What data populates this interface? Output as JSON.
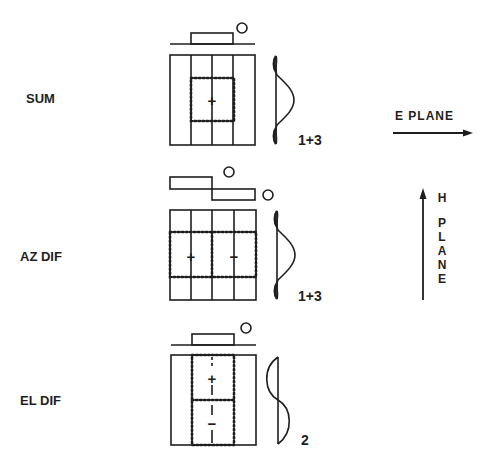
{
  "diagram": {
    "rows": [
      {
        "id": "sum",
        "label": "SUM",
        "center_sign": "+",
        "pattern_label": "1+3"
      },
      {
        "id": "az-dif",
        "label": "AZ DIF",
        "left_sign": "+",
        "right_sign": "−",
        "pattern_label": "1+3"
      },
      {
        "id": "el-dif",
        "label": "EL DIF",
        "top_sign": "+",
        "bottom_sign": "−",
        "pattern_label": "2"
      }
    ],
    "e_plane": {
      "label": "E PLANE"
    },
    "h_plane": {
      "letters": [
        "H",
        "P",
        "L",
        "A",
        "N",
        "E"
      ]
    },
    "colors": {
      "ink": "#1e1e1e",
      "background": "#ffffff"
    }
  }
}
